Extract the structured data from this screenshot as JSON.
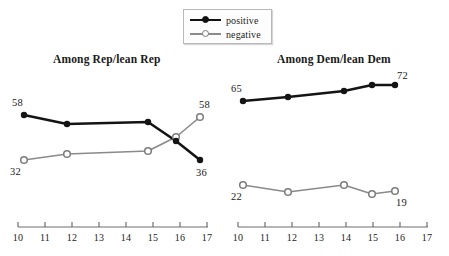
{
  "legend": {
    "items": [
      {
        "label": "positive",
        "color": "#111111",
        "marker": "filled-circle"
      },
      {
        "label": "negative",
        "color": "#8a8a8a",
        "marker": "open-circle"
      }
    ]
  },
  "panels": {
    "left": {
      "title": "Among Rep/lean Rep"
    },
    "right": {
      "title": "Among Dem/lean Dem"
    }
  },
  "axis": {
    "tick_labels": [
      "10",
      "11",
      "12",
      "13",
      "14",
      "15",
      "16",
      "17"
    ]
  },
  "labels": {
    "left_positive_start": "58",
    "left_positive_end": "36",
    "left_negative_start": "32",
    "left_negative_end": "58",
    "right_positive_start": "65",
    "right_positive_end": "72",
    "right_negative_start": "22",
    "right_negative_end": "19"
  },
  "chart_data": {
    "type": "line",
    "title": "",
    "subtitle": "",
    "xlabel": "",
    "ylabel": "",
    "xlim": [
      2010,
      2017.4
    ],
    "ylim": [
      0,
      100
    ],
    "grid": false,
    "legend_position": "top-center",
    "axis_ticks": [
      2010,
      2011,
      2012,
      2013,
      2014,
      2015,
      2016,
      2017
    ],
    "axis_tick_labels": [
      "10",
      "11",
      "12",
      "13",
      "14",
      "15",
      "16",
      "17"
    ],
    "panels": [
      {
        "title": "Among Rep/lean Rep",
        "x": [
          2010,
          2011.9,
          2015.5,
          2016.4,
          2017.2
        ],
        "series": [
          {
            "name": "positive",
            "color": "#111111",
            "marker": "filled-circle",
            "values": [
              58,
              55,
              55,
              46,
              36
            ],
            "labels": {
              "first": "58",
              "last": "36"
            }
          },
          {
            "name": "negative",
            "color": "#8a8a8a",
            "marker": "open-circle",
            "values": [
              32,
              36,
              37,
              47,
              58
            ],
            "labels": {
              "first": "32",
              "last": "58"
            }
          }
        ]
      },
      {
        "title": "Among Dem/lean Dem",
        "x": [
          2010,
          2011.9,
          2015.5,
          2016.4,
          2017.2
        ],
        "series": [
          {
            "name": "positive",
            "color": "#111111",
            "marker": "filled-circle",
            "values": [
              65,
              67,
              69,
              72,
              72
            ],
            "labels": {
              "first": "65",
              "last": "72"
            }
          },
          {
            "name": "negative",
            "color": "#8a8a8a",
            "marker": "open-circle",
            "values": [
              22,
              20,
              22,
              19,
              19
            ],
            "labels": {
              "first": "22",
              "last": "19"
            }
          }
        ]
      }
    ]
  }
}
